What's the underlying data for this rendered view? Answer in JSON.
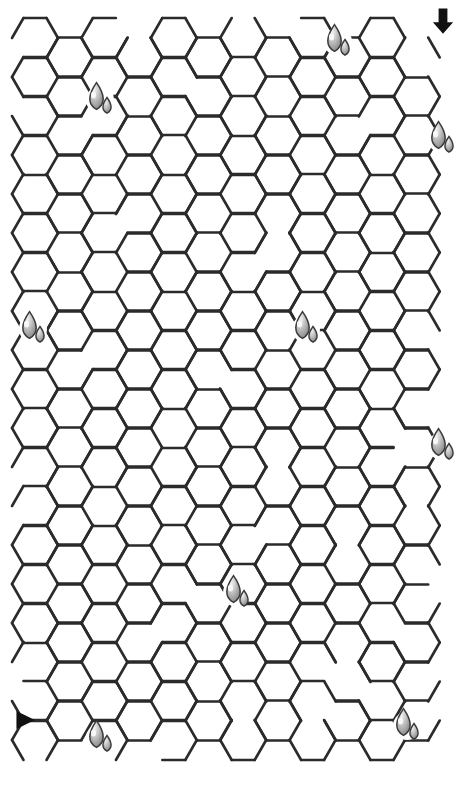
{
  "puzzle": {
    "kind": "honeycomb-maze",
    "title": "Honeycomb Maze",
    "canvas": {
      "width": 475,
      "height": 785,
      "background": "#ffffff"
    },
    "colors": {
      "wall": "#2b2b2b",
      "background": "#ffffff",
      "arrow": "#111111",
      "drop_fill_light": "#e8e8e8",
      "drop_fill_mid": "#b9b9b9",
      "drop_fill_dark": "#8f8f8f",
      "drop_outline": "#3a3a3a"
    },
    "geometry": {
      "orientation": "flat-top",
      "hex_width": 46,
      "hex_height": 40,
      "col_pitch": 34.7,
      "row_pitch": 39.0,
      "origin_x": 12,
      "origin_y": 18,
      "columns": 13,
      "rows": 20,
      "wall_stroke": 2.6
    },
    "entrance": {
      "label": "entrance-arrow",
      "glyph": "arrow-down",
      "x": 443,
      "y": 20,
      "size": 22,
      "direction": "down"
    },
    "exit": {
      "label": "exit-arrow",
      "glyph": "triangle-right",
      "x": 24,
      "y": 720,
      "size": 18,
      "direction": "right"
    },
    "honey_drops": [
      {
        "col": 1,
        "row": 2,
        "cx": 100,
        "cy": 100
      },
      {
        "col": 9,
        "row": 0,
        "cx": 338,
        "cy": 42
      },
      {
        "col": 12,
        "row": 3,
        "cx": 442,
        "cy": 139
      },
      {
        "col": 0,
        "row": 8,
        "cx": 33,
        "cy": 329
      },
      {
        "col": 8,
        "row": 8,
        "cx": 306,
        "cy": 329
      },
      {
        "col": 12,
        "row": 11,
        "cx": 442,
        "cy": 446
      },
      {
        "col": 6,
        "row": 14,
        "cx": 237,
        "cy": 593
      },
      {
        "col": 11,
        "row": 18,
        "cx": 407,
        "cy": 726
      },
      {
        "col": 2,
        "row": 18,
        "cx": 100,
        "cy": 738
      }
    ],
    "drop_sizes": {
      "large_rx": 9,
      "large_ry": 12,
      "small_rx": 5.5,
      "small_ry": 7
    },
    "wall_seed": 20240517,
    "open_wall_ratio": 0.34
  }
}
